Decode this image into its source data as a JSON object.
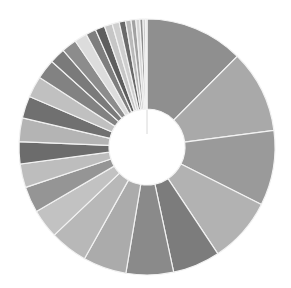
{
  "chart_data": {
    "type": "pie",
    "variant": "donut",
    "title": "",
    "legend": "none",
    "labels_shown": false,
    "start_angle_deg": 0,
    "direction": "clockwise",
    "center": [
      147,
      147
    ],
    "outer_radius": 128,
    "inner_radius": 38,
    "separator_color": "#f2f2f2",
    "categories": [
      "S1",
      "S2",
      "S3",
      "S4",
      "S5",
      "S6",
      "S7",
      "S8",
      "S9",
      "S10",
      "S11",
      "S12",
      "S13",
      "S14",
      "S15",
      "S16",
      "S17",
      "S18",
      "S19",
      "S20",
      "S21",
      "S22",
      "S23",
      "S24",
      "S25",
      "S26",
      "S27",
      "S28",
      "S29",
      "S30"
    ],
    "values": [
      12.5,
      10.5,
      9.5,
      8.3,
      6.0,
      6.0,
      5.5,
      4.8,
      3.7,
      3.3,
      3.0,
      2.8,
      3.0,
      2.8,
      2.7,
      2.5,
      2.0,
      1.9,
      1.6,
      1.3,
      1.2,
      1.0,
      0.9,
      0.8,
      0.7,
      0.6,
      0.5,
      0.4,
      0.3,
      0.2
    ],
    "colors": [
      "#8f8f8f",
      "#a9a9a9",
      "#9a9a9a",
      "#b2b2b2",
      "#7c7c7c",
      "#8a8a8a",
      "#ababab",
      "#b8b8b8",
      "#c2c2c2",
      "#959595",
      "#bdbdbd",
      "#6c6c6c",
      "#b4b4b4",
      "#707070",
      "#c0c0c0",
      "#828282",
      "#7a7a7a",
      "#8c8c8c",
      "#dcdcdc",
      "#7e7e7e",
      "#5e5e5e",
      "#c6c6c6",
      "#cfcfcf",
      "#6a6a6a",
      "#bababa",
      "#a2a2a2",
      "#d4d4d4",
      "#8e8e8e",
      "#c8c8c8",
      "#e0e0e0"
    ]
  }
}
